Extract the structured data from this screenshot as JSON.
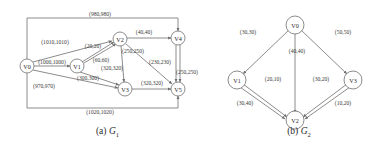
{
  "figure": {
    "panels": [
      {
        "id": "G1",
        "caption_prefix": "(a)",
        "caption_symbol": "G",
        "caption_subscript": "1",
        "nodes": [
          {
            "id": "V0",
            "label": "V0",
            "x": 27,
            "y": 66
          },
          {
            "id": "V1",
            "label": "V1",
            "x": 77,
            "y": 66
          },
          {
            "id": "V2",
            "label": "V2",
            "x": 120,
            "y": 39
          },
          {
            "id": "V3",
            "label": "V3",
            "x": 125,
            "y": 89
          },
          {
            "id": "V4",
            "label": "V4",
            "x": 178,
            "y": 38
          },
          {
            "id": "V5",
            "label": "V5",
            "x": 178,
            "y": 89
          }
        ],
        "edges": [
          {
            "from": "V0",
            "to": "V4",
            "label": "(980,980)",
            "lx": 100,
            "ly": 14
          },
          {
            "from": "V0",
            "to": "V2",
            "label": "(1010,1010)",
            "lx": 55,
            "ly": 42
          },
          {
            "from": "V0",
            "to": "V1",
            "label": "(1000,1000)",
            "lx": 52,
            "ly": 62
          },
          {
            "from": "V0",
            "to": "V3",
            "label": "(970,970)",
            "lx": 44,
            "ly": 86
          },
          {
            "from": "V0",
            "to": "V5",
            "label": "(1020,1020)",
            "lx": 100,
            "ly": 112
          },
          {
            "from": "V1",
            "to": "V2",
            "label": "(20,20)",
            "lx": 93,
            "ly": 46
          },
          {
            "from": "V1",
            "to": "V2",
            "label": "(60,60)",
            "lx": 101,
            "ly": 60
          },
          {
            "from": "V1",
            "to": "V3",
            "label": "(300,300)",
            "lx": 88,
            "ly": 78
          },
          {
            "from": "V2",
            "to": "V4",
            "label": "(40,40)",
            "lx": 144,
            "ly": 32
          },
          {
            "from": "V2",
            "to": "V3",
            "label": "(320,320)",
            "lx": 112,
            "ly": 68
          },
          {
            "from": "V2",
            "to": "V5",
            "label": "(250,250)",
            "lx": 133,
            "ly": 51
          },
          {
            "from": "V2",
            "to": "V5",
            "label": "(230,230)",
            "lx": 160,
            "ly": 62
          },
          {
            "from": "V4",
            "to": "V5",
            "label": "(250,250)",
            "lx": 185,
            "ly": 72
          },
          {
            "from": "V3",
            "to": "V5",
            "label": "(320,320)",
            "lx": 152,
            "ly": 83
          }
        ]
      },
      {
        "id": "G2",
        "caption_prefix": "(b)",
        "caption_symbol": "G",
        "caption_subscript": "2",
        "nodes": [
          {
            "id": "V0",
            "label": "V0",
            "x": 80,
            "y": 25
          },
          {
            "id": "V1",
            "label": "V1",
            "x": 22,
            "y": 80
          },
          {
            "id": "V3",
            "label": "V3",
            "x": 138,
            "y": 80
          },
          {
            "id": "V2",
            "label": "V2",
            "x": 80,
            "y": 120
          }
        ],
        "edges": [
          {
            "from": "V0",
            "to": "V1",
            "label": "(30,30)",
            "lx": 33,
            "ly": 32
          },
          {
            "from": "V0",
            "to": "V2",
            "label": "(40,40)",
            "lx": 82,
            "ly": 51
          },
          {
            "from": "V0",
            "to": "V3",
            "label": "(50,50)",
            "lx": 128,
            "ly": 32
          },
          {
            "from": "V1",
            "to": "V2",
            "label": "(20,10)",
            "lx": 58,
            "ly": 79
          },
          {
            "from": "V1",
            "to": "V2",
            "label": "(30,40)",
            "lx": 30,
            "ly": 103
          },
          {
            "from": "V3",
            "to": "V2",
            "label": "(30,20)",
            "lx": 106,
            "ly": 79
          },
          {
            "from": "V3",
            "to": "V2",
            "label": "(10,20)",
            "lx": 128,
            "ly": 103
          }
        ]
      }
    ]
  }
}
